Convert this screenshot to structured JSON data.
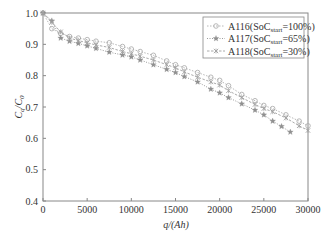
{
  "chart_data": {
    "type": "line",
    "title": "",
    "xlabel": "q/(Ah)",
    "ylabel": "Cq/C0",
    "xlim": [
      0,
      30000
    ],
    "ylim": [
      0.4,
      1.0
    ],
    "xticks": [
      0,
      5000,
      10000,
      15000,
      20000,
      25000,
      30000
    ],
    "xtick_labels": [
      "0",
      "5000",
      "10000",
      "15000",
      "20000",
      "25000",
      "30000"
    ],
    "yticks": [
      0.4,
      0.5,
      0.6,
      0.7,
      0.8,
      0.9,
      1.0
    ],
    "ytick_labels": [
      "0.4",
      "0.5",
      "0.6",
      "0.7",
      "0.8",
      "0.9",
      "1.0"
    ],
    "grid": false,
    "legend_position": "top-right",
    "series": [
      {
        "name": "A116(SoC_start=100%)",
        "label_main": "A116(SoC",
        "label_sub": "start",
        "label_tail": "=100%)",
        "marker": "circle",
        "color": "#b0b0b0",
        "x": [
          0,
          1000,
          2000,
          3000,
          4000,
          5000,
          6000,
          7500,
          9000,
          10000,
          11000,
          12500,
          14000,
          15000,
          16000,
          17500,
          19000,
          20000,
          21000,
          22500,
          24000,
          25000,
          26000,
          27500,
          29000,
          30000
        ],
        "y": [
          1.0,
          0.95,
          0.935,
          0.925,
          0.92,
          0.915,
          0.91,
          0.905,
          0.893,
          0.885,
          0.877,
          0.865,
          0.847,
          0.835,
          0.825,
          0.81,
          0.795,
          0.785,
          0.768,
          0.74,
          0.72,
          0.705,
          0.695,
          0.675,
          0.655,
          0.64
        ]
      },
      {
        "name": "A117(SoC_start=65%)",
        "label_main": "A117(SoC",
        "label_sub": "start",
        "label_tail": "=65%)",
        "marker": "star",
        "color": "#909090",
        "x": [
          0,
          1000,
          2000,
          3000,
          4000,
          5000,
          6000,
          7500,
          9000,
          10000,
          11000,
          12500,
          14000,
          15000,
          16000,
          17500,
          19000,
          20000,
          21000,
          22500,
          24000,
          25000,
          26000,
          27000,
          28000
        ],
        "y": [
          1.0,
          0.975,
          0.92,
          0.91,
          0.903,
          0.895,
          0.887,
          0.875,
          0.866,
          0.86,
          0.85,
          0.835,
          0.82,
          0.81,
          0.797,
          0.78,
          0.757,
          0.745,
          0.73,
          0.71,
          0.69,
          0.675,
          0.655,
          0.638,
          0.62
        ]
      },
      {
        "name": "A118(SoC_start=30%)",
        "label_main": "A118(SoC",
        "label_sub": "start",
        "label_tail": "=30%)",
        "marker": "cross",
        "color": "#a0a0a0",
        "x": [
          0,
          1000,
          2000,
          3000,
          4000,
          5000,
          6000,
          7500,
          9000,
          10000,
          11000,
          12500,
          14000,
          15000,
          16000,
          17500,
          19000,
          20000,
          21000,
          22500,
          24000,
          25000,
          26000,
          27500,
          29000,
          30000
        ],
        "y": [
          1.0,
          0.97,
          0.94,
          0.92,
          0.912,
          0.905,
          0.898,
          0.89,
          0.877,
          0.87,
          0.862,
          0.85,
          0.835,
          0.825,
          0.812,
          0.795,
          0.78,
          0.77,
          0.752,
          0.73,
          0.708,
          0.695,
          0.685,
          0.665,
          0.64,
          0.625
        ]
      }
    ]
  }
}
